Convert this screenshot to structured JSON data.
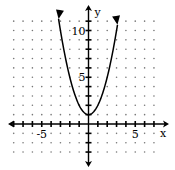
{
  "chart_data": {
    "type": "line",
    "title": "",
    "xlabel": "x",
    "ylabel": "y",
    "xlim": [
      -8,
      7
    ],
    "ylim": [
      -4,
      12
    ],
    "grid": "dotted",
    "xticks": [
      -8,
      -7,
      -6,
      -5,
      -4,
      -3,
      -2,
      -1,
      1,
      2,
      3,
      4,
      5,
      6,
      7
    ],
    "yticks": [
      -3,
      -2,
      -1,
      1,
      2,
      3,
      4,
      5,
      6,
      7,
      8,
      9,
      10,
      11
    ],
    "xtick_labels": [
      {
        "value": -5,
        "text": "-5"
      },
      {
        "value": 5,
        "text": "5"
      }
    ],
    "ytick_labels": [
      {
        "value": 5,
        "text": "5"
      },
      {
        "value": 10,
        "text": "10"
      }
    ],
    "series": [
      {
        "name": "y = x^2 + 1",
        "function": "x^2 + 1",
        "vertex": [
          0,
          1
        ],
        "domain": [
          -3.2,
          3.1
        ],
        "arrows_at_ends": true,
        "color": "#000000"
      }
    ]
  }
}
